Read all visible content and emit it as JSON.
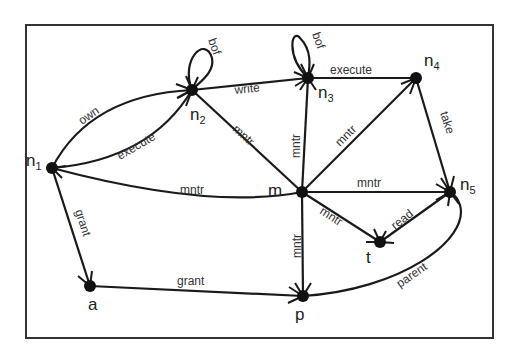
{
  "diagram": {
    "type": "directed-graph",
    "colors": {
      "edge": "#1a1a1a",
      "node": "#111111",
      "label": "#333333",
      "frame": "#333333",
      "background": "#ffffff"
    },
    "nodes": [
      {
        "id": "n1",
        "label": "n",
        "sub": "1"
      },
      {
        "id": "n2",
        "label": "n",
        "sub": "2"
      },
      {
        "id": "n3",
        "label": "n",
        "sub": "3"
      },
      {
        "id": "n4",
        "label": "n",
        "sub": "4"
      },
      {
        "id": "n5",
        "label": "n",
        "sub": "5"
      },
      {
        "id": "m",
        "label": "m",
        "sub": ""
      },
      {
        "id": "t",
        "label": "t",
        "sub": ""
      },
      {
        "id": "a",
        "label": "a",
        "sub": ""
      },
      {
        "id": "p",
        "label": "p",
        "sub": ""
      }
    ],
    "edges": [
      {
        "from": "n1",
        "to": "n2",
        "label": "own"
      },
      {
        "from": "n1",
        "to": "n2",
        "label": "execute"
      },
      {
        "from": "n2",
        "to": "n2",
        "label": "bof"
      },
      {
        "from": "n2",
        "to": "n3",
        "label": "write"
      },
      {
        "from": "n3",
        "to": "n3",
        "label": "bof"
      },
      {
        "from": "n3",
        "to": "n4",
        "label": "execute"
      },
      {
        "from": "m",
        "to": "n2",
        "label": "mntr"
      },
      {
        "from": "m",
        "to": "n3",
        "label": "mntr"
      },
      {
        "from": "m",
        "to": "n4",
        "label": "mntr"
      },
      {
        "from": "m",
        "to": "n1",
        "label": "mntr"
      },
      {
        "from": "m",
        "to": "n5",
        "label": "mntr"
      },
      {
        "from": "m",
        "to": "t",
        "label": "mntr"
      },
      {
        "from": "m",
        "to": "p",
        "label": "mntr"
      },
      {
        "from": "n4",
        "to": "n5",
        "label": "take"
      },
      {
        "from": "n5",
        "to": "t",
        "label": "read"
      },
      {
        "from": "n1",
        "to": "a",
        "label": "grant"
      },
      {
        "from": "a",
        "to": "p",
        "label": "grant"
      },
      {
        "from": "p",
        "to": "n5",
        "label": "parent"
      }
    ]
  }
}
